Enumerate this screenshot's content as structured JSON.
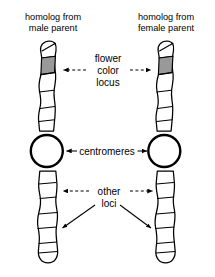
{
  "figure": {
    "background_color": "#ffffff",
    "line_color": "#000000",
    "locus_band_color": "#999999"
  },
  "headers": {
    "left": {
      "line1": "homolog from",
      "line2": "male parent"
    },
    "right": {
      "line1": "homolog from",
      "line2": "female parent"
    }
  },
  "annotations": {
    "flower_locus": {
      "line1": "flower",
      "line2": "color",
      "line3": "locus"
    },
    "centromeres": {
      "label": "centromeres"
    },
    "other_loci": {
      "line1": "other",
      "line2": "loci"
    }
  },
  "chromosomes": {
    "left": {
      "name": "male-parent-homolog",
      "locus_band_shaded": true
    },
    "right": {
      "name": "female-parent-homolog",
      "locus_band_shaded": true
    }
  }
}
